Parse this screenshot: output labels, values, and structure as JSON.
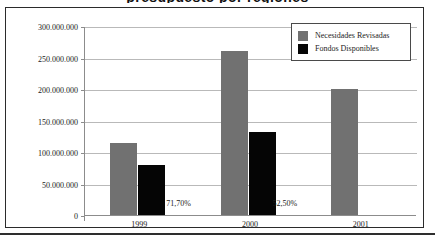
{
  "figure": {
    "title_partial": "presupuesto por regiones",
    "frame_visible": true
  },
  "legend": {
    "position": "top-right",
    "entries": [
      {
        "label": "Necesidades Revisadas",
        "color": "#717171",
        "swatch": "legend-swatch-gray"
      },
      {
        "label": "Fondos Disponibles",
        "color": "#050505",
        "swatch": "legend-swatch-black"
      }
    ]
  },
  "chart_data": {
    "type": "bar",
    "title": "",
    "xlabel": "",
    "ylabel": "",
    "categories": [
      "1999",
      "2000",
      "2001"
    ],
    "series": [
      {
        "name": "Necesidades Revisadas",
        "color": "#717171",
        "values": [
          115000000,
          260000000,
          200000000
        ]
      },
      {
        "name": "Fondos Disponibles",
        "color": "#050505",
        "values": [
          80000000,
          131000000,
          null
        ]
      }
    ],
    "ylim": [
      0,
      300000000
    ],
    "ytick_values": [
      0,
      50000000,
      100000000,
      150000000,
      200000000,
      250000000,
      300000000
    ],
    "ytick_labels": [
      "0",
      "50.000.000",
      "100.000.000",
      "150.000.000",
      "200.000.000",
      "250.000.000",
      "300.000.000"
    ],
    "grid": true,
    "legend_position": "top-right",
    "annotations": [
      {
        "text": "71,70%",
        "category": "1999",
        "x_frac": 0.245,
        "y_value": 20000000
      },
      {
        "text": "52,50%",
        "category": "2000",
        "x_frac": 0.565,
        "y_value": 20000000
      }
    ]
  },
  "colors": {
    "series_a": "#717171",
    "series_b": "#050505",
    "gridline": "#b9b9b9",
    "axis": "#8c8c8c",
    "frame": "#2b2b2b",
    "background": "#ffffff"
  }
}
